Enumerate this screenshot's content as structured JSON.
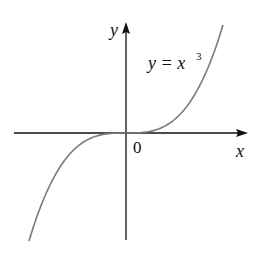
{
  "figure": {
    "equation_label": {
      "base": "y = x",
      "exponent": "3"
    },
    "x_axis_label": "x",
    "y_axis_label": "y",
    "origin_label": "0",
    "colors": {
      "axis": "#111111",
      "curve": "#7a7a7a",
      "background": "#ffffff"
    }
  },
  "chart_data": {
    "type": "line",
    "xlabel": "x",
    "ylabel": "y",
    "series": [
      {
        "name": "y = x^3",
        "function": "x^3",
        "x": [
          -1.0,
          -0.75,
          -0.5,
          -0.25,
          0,
          0.25,
          0.5,
          0.75,
          1.0
        ],
        "values": [
          -1.0,
          -0.421875,
          -0.125,
          -0.015625,
          0,
          0.015625,
          0.125,
          0.421875,
          1.0
        ]
      }
    ],
    "annotations": [
      "0",
      "y = x^3"
    ],
    "grid": false,
    "ticks": "none"
  }
}
